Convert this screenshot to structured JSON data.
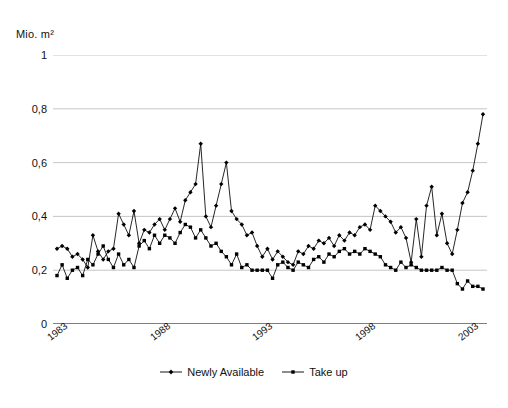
{
  "chart_data": {
    "type": "line",
    "title": "",
    "subtitle": "",
    "ylabel": "Mio. m²",
    "xlabel": "",
    "ylim": [
      0,
      1
    ],
    "yticks": [
      0,
      0.2,
      0.4,
      0.6,
      0.8,
      1
    ],
    "ytick_labels": [
      "0",
      "0,2",
      "0,4",
      "0,6",
      "0,8",
      "1"
    ],
    "grid": "horizontal",
    "legend_position": "bottom-center",
    "x_axis": {
      "unit": "quarter",
      "start": "1983-Q1",
      "end": "2003-Q4",
      "tick_interval": "quarterly",
      "label_interval_years": 5,
      "labelled_years": [
        "1983",
        "1988",
        "1993",
        "1998",
        "2003"
      ],
      "label_positions_index": [
        0,
        20,
        40,
        60,
        80
      ],
      "n_points": 84
    },
    "x": [
      "1983-Q1",
      "1983-Q2",
      "1983-Q3",
      "1983-Q4",
      "1984-Q1",
      "1984-Q2",
      "1984-Q3",
      "1984-Q4",
      "1985-Q1",
      "1985-Q2",
      "1985-Q3",
      "1985-Q4",
      "1986-Q1",
      "1986-Q2",
      "1986-Q3",
      "1986-Q4",
      "1987-Q1",
      "1987-Q2",
      "1987-Q3",
      "1987-Q4",
      "1988-Q1",
      "1988-Q2",
      "1988-Q3",
      "1988-Q4",
      "1989-Q1",
      "1989-Q2",
      "1989-Q3",
      "1989-Q4",
      "1990-Q1",
      "1990-Q2",
      "1990-Q3",
      "1990-Q4",
      "1991-Q1",
      "1991-Q2",
      "1991-Q3",
      "1991-Q4",
      "1992-Q1",
      "1992-Q2",
      "1992-Q3",
      "1992-Q4",
      "1993-Q1",
      "1993-Q2",
      "1993-Q3",
      "1993-Q4",
      "1994-Q1",
      "1994-Q2",
      "1994-Q3",
      "1994-Q4",
      "1995-Q1",
      "1995-Q2",
      "1995-Q3",
      "1995-Q4",
      "1996-Q1",
      "1996-Q2",
      "1996-Q3",
      "1996-Q4",
      "1997-Q1",
      "1997-Q2",
      "1997-Q3",
      "1997-Q4",
      "1998-Q1",
      "1998-Q2",
      "1998-Q3",
      "1998-Q4",
      "1999-Q1",
      "1999-Q2",
      "1999-Q3",
      "1999-Q4",
      "2000-Q1",
      "2000-Q2",
      "2000-Q3",
      "2000-Q4",
      "2001-Q1",
      "2001-Q2",
      "2001-Q3",
      "2001-Q4",
      "2002-Q1",
      "2002-Q2",
      "2002-Q3",
      "2002-Q4",
      "2003-Q1",
      "2003-Q2",
      "2003-Q3",
      "2003-Q4"
    ],
    "series": [
      {
        "name": "Newly Available",
        "marker": "diamond",
        "color": "#000000",
        "values": [
          0.28,
          0.29,
          0.28,
          0.25,
          0.26,
          0.24,
          0.21,
          0.33,
          0.27,
          0.24,
          0.27,
          0.28,
          0.41,
          0.37,
          0.33,
          0.42,
          0.3,
          0.35,
          0.34,
          0.37,
          0.39,
          0.35,
          0.39,
          0.43,
          0.38,
          0.46,
          0.49,
          0.52,
          0.67,
          0.4,
          0.36,
          0.44,
          0.52,
          0.6,
          0.42,
          0.39,
          0.37,
          0.33,
          0.34,
          0.29,
          0.25,
          0.28,
          0.24,
          0.27,
          0.25,
          0.23,
          0.22,
          0.27,
          0.26,
          0.29,
          0.28,
          0.31,
          0.3,
          0.32,
          0.29,
          0.33,
          0.31,
          0.34,
          0.33,
          0.36,
          0.37,
          0.35,
          0.44,
          0.42,
          0.4,
          0.38,
          0.34,
          0.36,
          0.32,
          0.23,
          0.39,
          0.25,
          0.44,
          0.51,
          0.33,
          0.41,
          0.3,
          0.26,
          0.35,
          0.45,
          0.49,
          0.57,
          0.67,
          0.78
        ]
      },
      {
        "name": "Take up",
        "marker": "square",
        "color": "#000000",
        "values": [
          0.18,
          0.22,
          0.17,
          0.2,
          0.21,
          0.18,
          0.24,
          0.22,
          0.26,
          0.29,
          0.24,
          0.21,
          0.26,
          0.22,
          0.24,
          0.21,
          0.29,
          0.31,
          0.28,
          0.33,
          0.3,
          0.33,
          0.32,
          0.3,
          0.34,
          0.37,
          0.36,
          0.32,
          0.35,
          0.32,
          0.29,
          0.3,
          0.27,
          0.25,
          0.22,
          0.26,
          0.21,
          0.22,
          0.2,
          0.2,
          0.2,
          0.2,
          0.17,
          0.22,
          0.23,
          0.21,
          0.2,
          0.23,
          0.22,
          0.21,
          0.24,
          0.25,
          0.23,
          0.26,
          0.25,
          0.27,
          0.28,
          0.26,
          0.27,
          0.26,
          0.28,
          0.27,
          0.26,
          0.25,
          0.22,
          0.21,
          0.2,
          0.23,
          0.21,
          0.22,
          0.21,
          0.2,
          0.2,
          0.2,
          0.2,
          0.21,
          0.2,
          0.2,
          0.15,
          0.13,
          0.16,
          0.14,
          0.14,
          0.13
        ]
      }
    ]
  },
  "legend": {
    "items": [
      {
        "label": "Newly Available"
      },
      {
        "label": "Take up"
      }
    ]
  },
  "colors": {
    "series": "#000000",
    "gridline": "#b7b7b7",
    "axis": "#000000",
    "text": "#111111"
  }
}
